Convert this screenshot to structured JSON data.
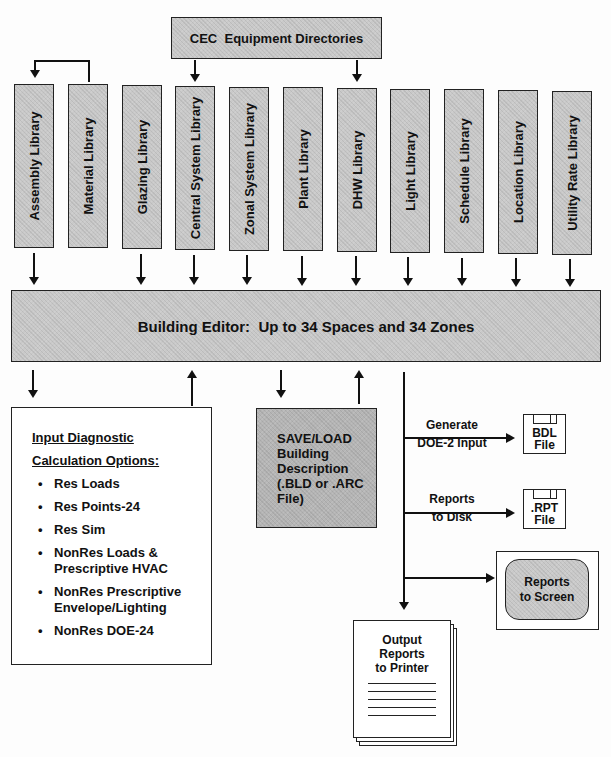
{
  "top_source": {
    "label": "CEC  Equipment Directories"
  },
  "libraries": [
    {
      "label": "Assembly Library"
    },
    {
      "label": "Material Library"
    },
    {
      "label": "Glazing Library"
    },
    {
      "label": "Central System Library"
    },
    {
      "label": "Zonal System Library"
    },
    {
      "label": "Plant Library"
    },
    {
      "label": "DHW Library"
    },
    {
      "label": "Light Library"
    },
    {
      "label": "Schedule Library"
    },
    {
      "label": "Location Library"
    },
    {
      "label": "Utility Rate Library"
    }
  ],
  "editor": {
    "label": "Building Editor:  Up to 34 Spaces and 34 Zones"
  },
  "options_box": {
    "heading_line1": "Input Diagnostic",
    "heading_line2": "Calculation Options:",
    "bullet": "•",
    "items": [
      "Res Loads",
      "Res Points-24",
      "Res Sim",
      "NonRes Loads & Prescriptive HVAC",
      "NonRes Prescriptive Envelope/Lighting",
      "NonRes DOE-24"
    ]
  },
  "save_load": {
    "label": "SAVE/LOAD Building Description (.BLD or .ARC File)"
  },
  "outputs": {
    "generate_label_1": "Generate",
    "generate_label_2": "DOE-2 Input",
    "bdl_file_1": "BDL",
    "bdl_file_2": "File",
    "reports_disk_1": "Reports",
    "reports_disk_2": "to Disk",
    "rpt_file_1": ".RPT",
    "rpt_file_2": "File",
    "screen_1": "Reports",
    "screen_2": "to Screen",
    "printer_1": "Output",
    "printer_2": "Reports",
    "printer_3": "to Printer"
  }
}
